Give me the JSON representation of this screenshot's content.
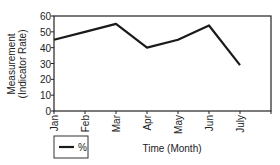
{
  "chart_data": {
    "type": "line",
    "title": "",
    "xlabel": "Time (Month)",
    "ylabel": "Measurement (Indicator Rate)",
    "ylabel_lines": [
      "Measurement",
      "(Indicator Rate)"
    ],
    "categories": [
      "Jan",
      "Feb",
      "Mar",
      "Apr",
      "May",
      "Jun",
      "July"
    ],
    "series": [
      {
        "name": "%",
        "values": [
          45,
          50,
          55,
          40,
          45,
          54,
          29
        ],
        "color": "#1a1a1a"
      }
    ],
    "ylim": [
      0,
      60
    ],
    "yticks": [
      0,
      10,
      20,
      30,
      40,
      50,
      60
    ],
    "grid": false,
    "legend_position": "bottom-left"
  },
  "legend": {
    "label": "%"
  }
}
